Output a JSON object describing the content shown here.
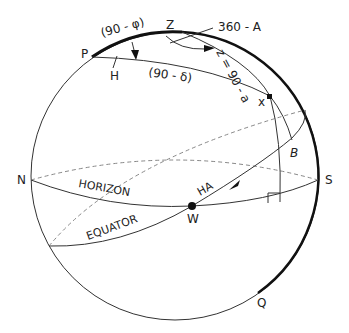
{
  "diagram": {
    "points": {
      "P": "P",
      "Z": "Z",
      "N": "N",
      "S": "S",
      "W": "W",
      "Q": "Q",
      "B": "B",
      "x": "x",
      "H": "H"
    },
    "arc_labels": {
      "colatitude": "(90 - φ)",
      "codeclination": "(90 - δ)",
      "azimuth": "360 - A",
      "zenith_distance": "z = 90 - a",
      "hour_angle": "HA"
    },
    "circle_labels": {
      "horizon": "HORIZON",
      "equator": "EQUATOR"
    }
  }
}
